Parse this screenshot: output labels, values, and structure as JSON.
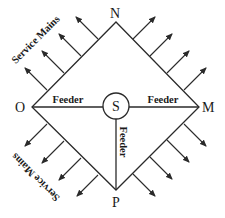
{
  "diagram": {
    "colors": {
      "line": "#2a2a2a",
      "text": "#1a1a1a",
      "background": "#ffffff"
    },
    "nodes": {
      "N": {
        "label": "N",
        "x": 116,
        "y": 22
      },
      "M": {
        "label": "M",
        "x": 199,
        "y": 107
      },
      "P": {
        "label": "P",
        "x": 116,
        "y": 190
      },
      "O": {
        "label": "O",
        "x": 32,
        "y": 107
      },
      "S": {
        "label": "S",
        "x": 116,
        "y": 106,
        "r": 13
      }
    },
    "feeders": [
      {
        "label": "Feeder",
        "from": "S",
        "to": "O"
      },
      {
        "label": "Feeder",
        "from": "S",
        "to": "M"
      },
      {
        "label": "Feeder",
        "from": "S",
        "to": "P"
      }
    ],
    "service_mains": [
      {
        "label": "Service Mains",
        "side": "upper-left"
      },
      {
        "label": "Service Mains",
        "side": "lower-left"
      }
    ],
    "arrow_groups": {
      "upper_left": 4,
      "upper_right": 4,
      "lower_left": 4,
      "lower_right": 4
    }
  }
}
